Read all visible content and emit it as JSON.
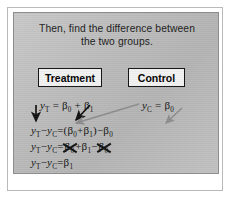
{
  "slide": {
    "title_line1": "Then, find the difference between",
    "title_line2": "the two groups.",
    "groups": {
      "treatment_label": "Treatment",
      "control_label": "Control"
    },
    "equations": {
      "treatment_model": {
        "lhs": "y",
        "lhs_sub": "T",
        "eq": " = ",
        "term1": "β",
        "term1_sub": "0",
        "op": " + ",
        "term2": "β",
        "term2_sub": "1",
        "plain": "y_T = β₀ + β₁"
      },
      "control_model": {
        "lhs": "y",
        "lhs_sub": "C",
        "eq": " = ",
        "term1": "β",
        "term1_sub": "0",
        "plain": "y_C = β₀"
      },
      "line2_plain": "y_T − y_C = (β₀ + β₁) − β₀",
      "line3_plain": "y_T − y_C = β₀ + β₁ − β₀",
      "line4_plain": "y_T − y_C = β₁",
      "symbols": {
        "y": "y",
        "sub_T": "T",
        "sub_C": "C",
        "minus": "−",
        "equals": "=",
        "plus": "+",
        "beta": "β",
        "sub_0": "0",
        "sub_1": "1",
        "lparen": "(",
        "rparen": ")"
      }
    },
    "annotations": {
      "black_arrow_label": "arrow from treatment model down to difference line",
      "gray_arrow_1_label": "arrow from control model to beta-0 in parentheses",
      "gray_arrow_2_label": "arrow from control model to subtracted beta-0",
      "black_arrow_2_label": "arrow from beta-0 plus beta-1 down to parentheses",
      "strikeout_label": "cancelled beta-0 terms"
    },
    "colors": {
      "slide_bg": "#bcbcbc",
      "box_bg": "#f2f2f2",
      "ink": "#111111",
      "gray_arrow": "#8c8c8c",
      "frame": "#b9b9b9"
    }
  }
}
